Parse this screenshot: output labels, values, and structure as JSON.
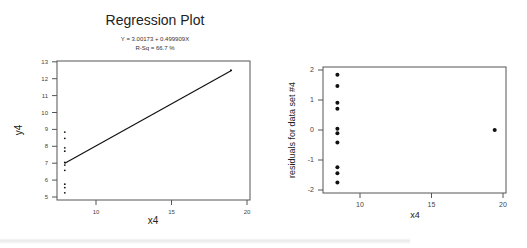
{
  "chart_data": [
    {
      "type": "scatter",
      "title": "Regression Plot",
      "subtitle": [
        "Y = 3.00173 + 0.499909X",
        "R-Sq = 66.7 %"
      ],
      "xlabel": "x4",
      "ylabel": "y4",
      "xlim": [
        8,
        20
      ],
      "ylim": [
        5,
        13
      ],
      "xticks": [
        10,
        15,
        20
      ],
      "yticks": [
        5,
        6,
        7,
        8,
        9,
        10,
        11,
        12,
        13
      ],
      "grid": false,
      "x": [
        8,
        8,
        8,
        8,
        8,
        8,
        8,
        8,
        8,
        8,
        19
      ],
      "y": [
        6.58,
        5.76,
        7.71,
        8.84,
        8.47,
        7.04,
        5.25,
        5.56,
        7.91,
        6.89,
        12.5
      ],
      "fit_line": {
        "intercept": 3.00173,
        "slope": 0.499909,
        "x_range": [
          8,
          19
        ]
      }
    },
    {
      "type": "scatter",
      "title": "",
      "xlabel": "x4",
      "ylabel": "residuals for data set #4",
      "xlim": [
        8,
        20
      ],
      "ylim": [
        -2,
        2
      ],
      "xticks": [
        10,
        15,
        20
      ],
      "yticks": [
        -2,
        -1,
        0,
        1,
        2
      ],
      "grid": false,
      "x": [
        8,
        8,
        8,
        8,
        8,
        8,
        8,
        8,
        8,
        8,
        19
      ],
      "y": [
        -0.42,
        -1.24,
        0.71,
        1.84,
        1.47,
        0.04,
        -1.75,
        -1.44,
        0.91,
        -0.11,
        0.0
      ]
    }
  ],
  "left": {
    "title": "Regression Plot",
    "equation": "Y = 3.00173 + 0.499909X",
    "rsq": "R-Sq = 66.7 %",
    "xlabel": "x4",
    "ylabel": "y4",
    "yticks": [
      "13",
      "12",
      "11",
      "10",
      "9",
      "8",
      "7",
      "6",
      "5"
    ],
    "xticks": [
      "10",
      "15",
      "20"
    ]
  },
  "right": {
    "xlabel": "x4",
    "ylabel": "residuals for data set #4",
    "yticks": [
      "2",
      "1",
      "0",
      "-1",
      "-2"
    ],
    "xticks": [
      "10",
      "15",
      "20"
    ]
  }
}
